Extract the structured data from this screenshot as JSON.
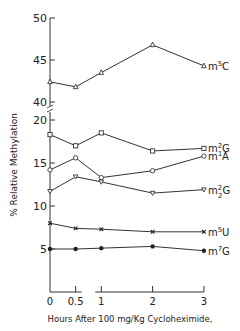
{
  "chart_data": {
    "type": "line",
    "title": "",
    "xlabel": "Hours After 100 mg/Kg Cycloheximide,",
    "ylabel": "% Relative Methylation",
    "x": [
      0,
      0.5,
      1,
      2,
      3
    ],
    "x_ticks": [
      "0",
      "0.5",
      "1",
      "2",
      "3"
    ],
    "y_ticks_lower": [
      "5",
      "10",
      "15",
      "20"
    ],
    "y_ticks_upper": [
      "40",
      "45",
      "50"
    ],
    "ylim_lower": [
      0,
      20
    ],
    "ylim_upper": [
      40,
      50
    ],
    "y_axis_break": true,
    "x_axis_break_between": [
      0.5,
      1
    ],
    "grid": false,
    "series": [
      {
        "name": "m5C",
        "label_base": "m",
        "label_sup": "5",
        "label_sub": "",
        "label_end": "C",
        "marker": "open-triangle",
        "values": [
          42.4,
          41.8,
          43.5,
          46.8,
          44.3
        ]
      },
      {
        "name": "m2G",
        "label_base": "m",
        "label_sup": "2",
        "label_sub": "",
        "label_end": "G",
        "marker": "open-square",
        "values": [
          18.3,
          17.0,
          18.5,
          16.4,
          16.7
        ]
      },
      {
        "name": "m1A",
        "label_base": "m",
        "label_sup": "1",
        "label_sub": "",
        "label_end": "A",
        "marker": "open-circle",
        "values": [
          14.2,
          15.6,
          13.3,
          14.1,
          15.8
        ]
      },
      {
        "name": "m2_2G",
        "label_base": "m",
        "label_sup": "2",
        "label_sub": "2",
        "label_end": "G",
        "marker": "open-triangle-down",
        "values": [
          11.7,
          13.4,
          12.8,
          11.5,
          11.9
        ]
      },
      {
        "name": "m5U",
        "label_base": "m",
        "label_sup": "5",
        "label_sub": "",
        "label_end": "U",
        "marker": "x",
        "values": [
          8.0,
          7.4,
          7.3,
          7.0,
          7.0
        ]
      },
      {
        "name": "m7G",
        "label_base": "m",
        "label_sup": "7",
        "label_sub": "",
        "label_end": "G",
        "marker": "filled-circle",
        "values": [
          5.0,
          5.0,
          5.1,
          5.3,
          4.8
        ]
      }
    ]
  }
}
